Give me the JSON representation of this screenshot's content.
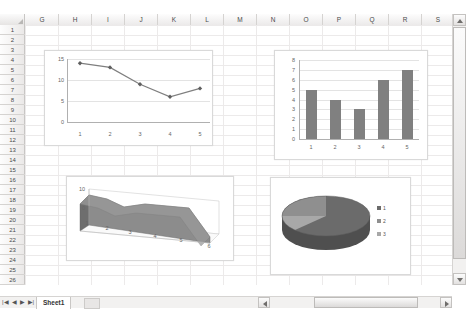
{
  "grid": {
    "columns": [
      "G",
      "H",
      "I",
      "J",
      "K",
      "L",
      "M",
      "N",
      "O",
      "P",
      "Q",
      "R",
      "S"
    ],
    "rows": [
      "1",
      "2",
      "3",
      "4",
      "5",
      "6",
      "7",
      "8",
      "9",
      "10",
      "11",
      "12",
      "13",
      "14",
      "15",
      "16",
      "17",
      "18",
      "19",
      "20",
      "21",
      "22",
      "23",
      "24",
      "25",
      "26"
    ],
    "select_all_icon": "select-all-corner-icon"
  },
  "sheet_tabs": {
    "first_icon": "first-sheet-icon",
    "prev_icon": "previous-sheet-icon",
    "next_icon": "next-sheet-icon",
    "last_icon": "last-sheet-icon",
    "active_sheet": "Sheet1",
    "new_sheet_icon": "insert-worksheet-icon"
  },
  "scrollbars": {
    "vertical": {
      "up_icon": "scroll-up-arrow-icon",
      "down_icon": "scroll-down-arrow-icon"
    },
    "horizontal": {
      "left_icon": "scroll-left-arrow-icon",
      "right_icon": "scroll-right-arrow-icon"
    }
  },
  "colors": {
    "series": "#808080",
    "series_dark": "#6e6e6e",
    "series_light": "#a6a6a6",
    "gridline": "#e3e3e3",
    "axis": "#b0b0b0"
  },
  "charts": [
    {
      "name": "line-chart",
      "chart_data": {
        "type": "line",
        "title": "",
        "xlabel": "",
        "ylabel": "",
        "categories": [
          "1",
          "2",
          "3",
          "4",
          "5"
        ],
        "values": [
          14,
          13,
          9,
          6,
          8
        ],
        "yticks": [
          "0",
          "5",
          "10",
          "15"
        ],
        "ylim": [
          0,
          15
        ],
        "grid": true,
        "legend": "none",
        "marker": "diamond",
        "color": "#7f7f7f"
      }
    },
    {
      "name": "bar-chart",
      "chart_data": {
        "type": "bar",
        "title": "",
        "xlabel": "",
        "ylabel": "",
        "categories": [
          "1",
          "2",
          "3",
          "4",
          "5"
        ],
        "values": [
          5,
          4,
          3,
          6,
          7
        ],
        "yticks": [
          "0",
          "1",
          "2",
          "3",
          "4",
          "5",
          "6",
          "7",
          "8"
        ],
        "ylim": [
          0,
          8
        ],
        "grid": true,
        "legend": "none",
        "color": "#808080"
      }
    },
    {
      "name": "area-chart-3d",
      "chart_data": {
        "type": "area",
        "title": "",
        "xlabel": "",
        "ylabel": "",
        "categories": [
          "1",
          "2",
          "3",
          "4",
          "5",
          "6"
        ],
        "values": [
          10,
          7,
          8,
          7,
          6,
          0
        ],
        "yticks": [
          "0",
          "10"
        ],
        "ylim": [
          0,
          10
        ],
        "grid": false,
        "legend": "none",
        "color": "#707070"
      }
    },
    {
      "name": "pie-chart-3d",
      "chart_data": {
        "type": "pie",
        "title": "",
        "labels": [
          "1",
          "2",
          "3"
        ],
        "values": [
          55,
          27,
          18
        ],
        "legend": "right",
        "colors": [
          "#6b6b6b",
          "#8f8f8f",
          "#a8a8a8"
        ]
      }
    }
  ]
}
